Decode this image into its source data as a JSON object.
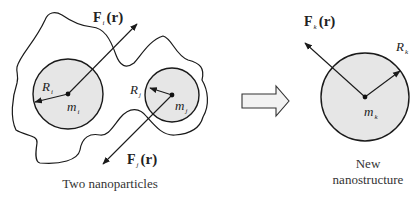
{
  "figure": {
    "left_panel": {
      "caption": "Two nanoparticles",
      "particle_i": {
        "mass_label": "m",
        "mass_sub": "i",
        "radius_label": "R",
        "radius_sub": "i",
        "force_label": "F",
        "force_sub": "i",
        "force_arg": "(r)"
      },
      "particle_j": {
        "mass_label": "m",
        "mass_sub": "j",
        "radius_label": "R",
        "radius_sub": "j",
        "force_label": "F",
        "force_sub": "j",
        "force_arg": "(r)"
      }
    },
    "transition_arrow": "block-right-arrow",
    "right_panel": {
      "caption_line1": "New",
      "caption_line2": "nanostructure",
      "particle_k": {
        "mass_label": "m",
        "mass_sub": "k",
        "radius_label": "R",
        "radius_sub": "k",
        "force_label": "F",
        "force_sub": "k",
        "force_arg": "(r)"
      }
    },
    "colors": {
      "particle_fill": "#e6e6e6",
      "stroke": "#1a1a1a",
      "background": "#ffffff"
    }
  }
}
